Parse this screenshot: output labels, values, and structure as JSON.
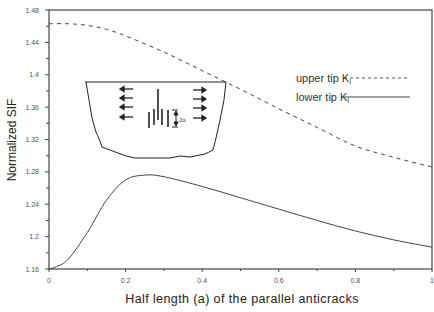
{
  "chart_data": {
    "type": "line",
    "title": "",
    "xlabel": "Half length (a) of the parallel anticracks",
    "ylabel": "Normalized SIF",
    "xlim": [
      0,
      1
    ],
    "ylim": [
      1.16,
      1.48
    ],
    "x_ticks": [
      "0",
      "0.2",
      "0.4",
      "0.6",
      "0.8",
      "1"
    ],
    "y_ticks": [
      "1.16",
      "1.2",
      "1.24",
      "1.28",
      "1.32",
      "1.36",
      "1.4",
      "1.44",
      "1.48"
    ],
    "grid": false,
    "legend_position": "upper right",
    "series": [
      {
        "name": "upper tip K_I",
        "style": "dashed",
        "x": [
          0,
          0.05,
          0.1,
          0.15,
          0.2,
          0.3,
          0.4,
          0.5,
          0.6,
          0.7,
          0.8,
          0.9,
          1.0
        ],
        "values": [
          1.463,
          1.463,
          1.461,
          1.456,
          1.448,
          1.428,
          1.405,
          1.382,
          1.358,
          1.335,
          1.312,
          1.298,
          1.286
        ]
      },
      {
        "name": "lower tip K_I",
        "style": "solid",
        "x": [
          0,
          0.02,
          0.05,
          0.1,
          0.15,
          0.2,
          0.25,
          0.3,
          0.4,
          0.5,
          0.6,
          0.7,
          0.8,
          0.9,
          1.0
        ],
        "values": [
          1.16,
          1.163,
          1.172,
          1.205,
          1.245,
          1.27,
          1.276,
          1.274,
          1.262,
          1.248,
          1.234,
          1.22,
          1.207,
          1.196,
          1.187
        ]
      }
    ],
    "inset": {
      "description": "schematic of half-space with parallel anticracks and horizontal arrows",
      "label": "2a"
    }
  },
  "legend": {
    "upper_label": "upper tip K",
    "lower_label": "lower tip K",
    "subscript": "I"
  }
}
